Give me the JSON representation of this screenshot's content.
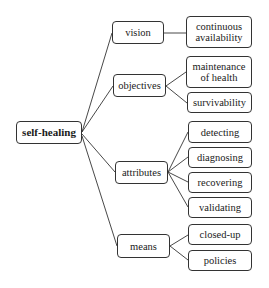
{
  "diagram": {
    "type": "tree",
    "root": {
      "label": "self-healing"
    },
    "branches": [
      {
        "label": "vision",
        "children": [
          "continuous availability"
        ]
      },
      {
        "label": "objectives",
        "children": [
          "maintenance of health",
          "survivability"
        ]
      },
      {
        "label": "attributes",
        "children": [
          "detecting",
          "diagnosing",
          "recovering",
          "validating"
        ]
      },
      {
        "label": "means",
        "children": [
          "closed-up",
          "policies"
        ]
      }
    ]
  }
}
